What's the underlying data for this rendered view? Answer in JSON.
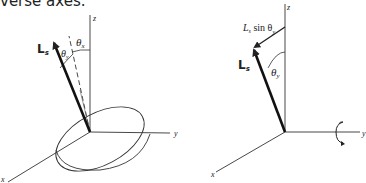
{
  "caption": "verse axes.",
  "left_diagram": {
    "axis_z": "z",
    "axis_y": "y",
    "axis_x": "x",
    "vector_label_main": "L",
    "vector_label_sub": "s",
    "angle_x_symbol": "θ",
    "angle_x_sub": "x",
    "angle_y_symbol": "θ",
    "angle_y_sub": "y"
  },
  "right_diagram": {
    "axis_z": "z",
    "axis_y": "y",
    "axis_x": "x",
    "vector_label_main": "L",
    "vector_label_sub": "s",
    "component_label_L": "L",
    "component_label_sub": "s",
    "component_label_sin": " sin θ",
    "component_label_sin_sub": "y",
    "angle_y_symbol": "θ",
    "angle_y_sub": "y"
  },
  "colors": {
    "stroke": "#222222",
    "background": "#ffffff"
  }
}
